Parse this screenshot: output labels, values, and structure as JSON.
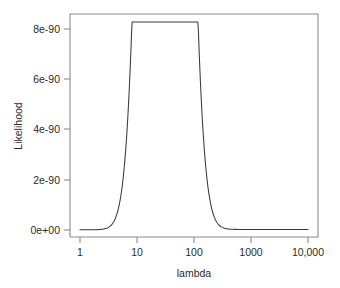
{
  "chart_data": {
    "type": "line",
    "title": "",
    "xlabel": "lambda",
    "ylabel": "Likelihood",
    "xscale": "log",
    "yscale": "linear",
    "xlim": [
      1,
      10000
    ],
    "ylim": [
      0,
      8.9e-90
    ],
    "grid": false,
    "legend": null,
    "xticks": [
      1,
      10,
      100,
      1000,
      10000
    ],
    "xtick_labels": [
      "1",
      "10",
      "100",
      "1000",
      "10,000"
    ],
    "yticks": [
      0,
      2e-90,
      4e-90,
      6e-90,
      8e-90
    ],
    "ytick_labels": [
      "0e+00",
      "2e-90",
      "4e-90",
      "6e-90",
      "8e-90"
    ],
    "series": [
      {
        "name": "Likelihood",
        "color": "#3a3a3a",
        "x": [
          1,
          1.5,
          2,
          3,
          4,
          5,
          6,
          7,
          8,
          9,
          10,
          12,
          14,
          16,
          18,
          20,
          22,
          25,
          28,
          31,
          34,
          38,
          42,
          46,
          50,
          56,
          62,
          70,
          80,
          90,
          100,
          120,
          140,
          170,
          200,
          250,
          300,
          400,
          500,
          700,
          1000,
          1500,
          2000,
          3000,
          5000,
          7000,
          10000
        ],
        "y": [
          1e-93,
          2e-93,
          4e-93,
          1.2e-92,
          3e-92,
          7e-92,
          1.6e-91,
          3.4e-91,
          7e-91,
          1.35e-90,
          2.4e-90,
          6.2e-90,
          1.25e-89,
          2.15e-89,
          3.2e-89,
          4.4e-89,
          5.5e-89,
          6.9e-89,
          7.9e-89,
          8.3e-90,
          8.1e-89,
          7.4e-89,
          6.5e-89,
          5.5e-89,
          4.6e-89,
          3.5e-89,
          2.6e-89,
          1.8e-89,
          1.1e-89,
          7e-90,
          4.6e-90,
          2.3e-90,
          1.3e-90,
          6.5e-91,
          3.8e-91,
          2e-91,
          1.3e-91,
          7e-92,
          5e-92,
          3.2e-92,
          2.2e-92,
          1.6e-92,
          1.4e-92,
          1.2e-92,
          1e-92,
          9.5e-93,
          9e-93
        ]
      }
    ],
    "peak": {
      "lambda": 31,
      "likelihood": "8.3e-90"
    }
  },
  "axes": {
    "y_title": "Likelihood",
    "x_title": "lambda",
    "y_tick_labels": [
      "8e-90",
      "6e-90",
      "4e-90",
      "2e-90",
      "0e+00"
    ],
    "x_tick_labels": [
      "1",
      "10",
      "100",
      "1000",
      "10,000"
    ]
  },
  "style": {
    "background": "#ffffff",
    "frame_color": "#8a8a8a",
    "curve_color": "#3a3a3a",
    "text_color": "#2b2b2b"
  }
}
